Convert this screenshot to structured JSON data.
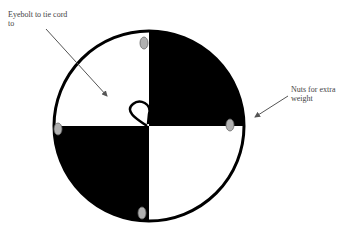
{
  "diagram": {
    "labels": {
      "eyebolt": "Eyebolt to tie cord to",
      "nuts": "Nuts for extra weight"
    },
    "colors": {
      "fill_dark": "#000000",
      "fill_light": "#ffffff",
      "nut": "#b0b0b0",
      "arrow": "#555555"
    },
    "parts": [
      "circle-disc",
      "quadrant-top-left",
      "quadrant-top-right",
      "quadrant-bottom-left",
      "quadrant-bottom-right",
      "eyebolt",
      "nut-top",
      "nut-left",
      "nut-right",
      "nut-bottom"
    ]
  }
}
